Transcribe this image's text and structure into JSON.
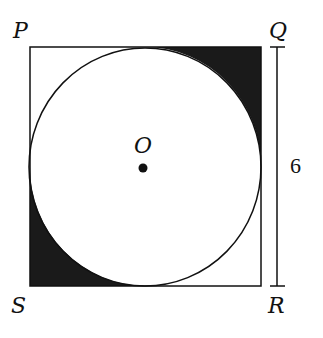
{
  "figure": {
    "type": "geometry-diagram",
    "labels": {
      "top_left": "P",
      "top_right": "Q",
      "bottom_right": "R",
      "bottom_left": "S",
      "center": "O"
    },
    "dimension": {
      "side": "QR",
      "value": "6"
    },
    "shaded_corners": [
      "Q",
      "S"
    ],
    "colors": {
      "stroke": "#111111",
      "shade": "#1a1a1a",
      "background": "#ffffff"
    }
  }
}
